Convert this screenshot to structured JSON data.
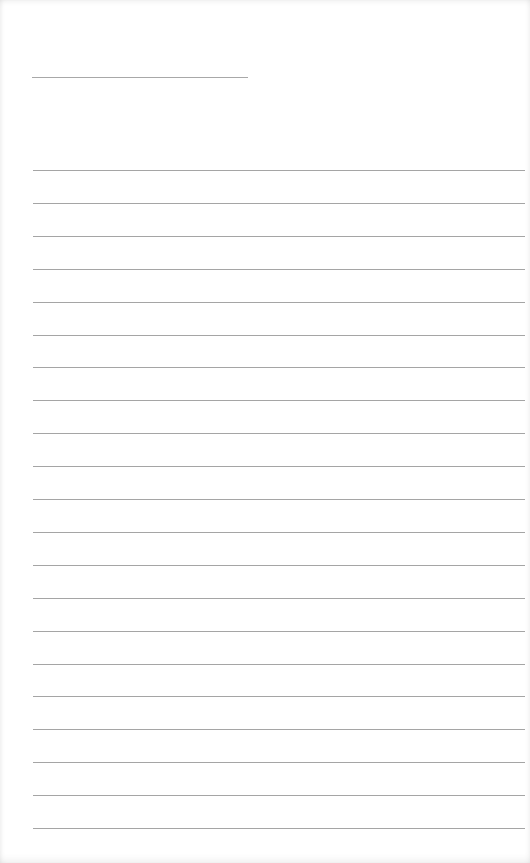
{
  "page": {
    "type": "lined-notepaper",
    "background_color": "#ffffff",
    "line_color": "#a5a5a5"
  },
  "title_line": {
    "x": 32,
    "y": 77,
    "width": 216
  },
  "ruled_lines": {
    "count": 21,
    "start_y": 170,
    "spacing": 32.9,
    "x": 33,
    "width": 492
  }
}
